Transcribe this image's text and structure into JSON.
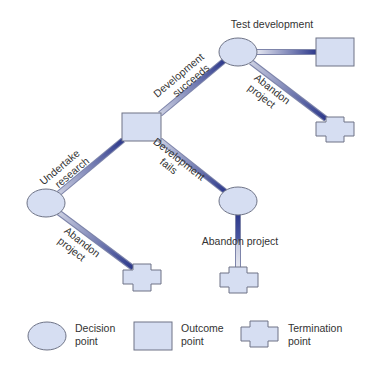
{
  "colors": {
    "node_fill": "#d6def2",
    "node_stroke": "#6e7386",
    "branch_dark": "#2e3a8c",
    "branch_light": "#c9cde0",
    "text": "#333333"
  },
  "nodes": {
    "decision_left": {
      "type": "decision"
    },
    "outcome_center": {
      "type": "outcome"
    },
    "decision_top": {
      "type": "decision"
    },
    "outcome_top_right": {
      "type": "outcome"
    },
    "termination_top_right": {
      "type": "termination"
    },
    "decision_middle": {
      "type": "decision"
    },
    "termination_middle": {
      "type": "termination"
    },
    "termination_left": {
      "type": "termination"
    }
  },
  "branches": {
    "undertake_research": {
      "line1": "Undertake",
      "line2": "research"
    },
    "development_succeeds": {
      "line1": "Development",
      "line2": "succeeds"
    },
    "development_fails": {
      "line1": "Development",
      "line2": "fails"
    },
    "test_development": {
      "label": "Test development"
    },
    "abandon_top": {
      "line1": "Abandon",
      "line2": "project"
    },
    "abandon_middle": {
      "label": "Abandon project"
    },
    "abandon_left": {
      "line1": "Abandon",
      "line2": "project"
    }
  },
  "legend": {
    "decision": {
      "line1": "Decision",
      "line2": "point"
    },
    "outcome": {
      "line1": "Outcome",
      "line2": "point"
    },
    "termination": {
      "line1": "Termination",
      "line2": "point"
    }
  }
}
